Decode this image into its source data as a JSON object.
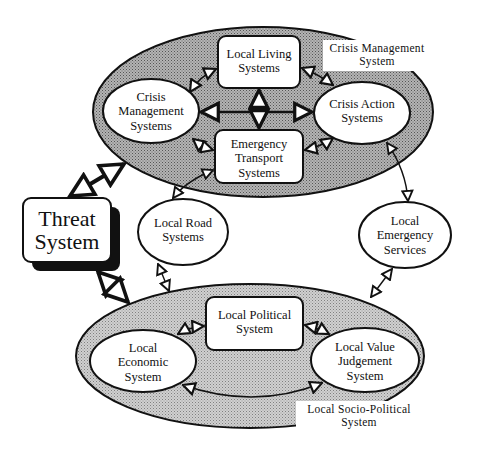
{
  "diagram": {
    "type": "system-interaction-diagram",
    "groups": [
      {
        "id": "crisis",
        "caption_line1": "Crisis Management",
        "caption_line2": "System"
      },
      {
        "id": "socio",
        "caption_line1": "Local Socio-Political",
        "caption_line2": "System"
      }
    ],
    "nodes": {
      "threat": {
        "line1": "Threat",
        "line2": "System"
      },
      "local_living": {
        "line1": "Local Living",
        "line2": "Systems"
      },
      "crisis_mgmt": {
        "line1": "Crisis",
        "line2": "Management",
        "line3": "Systems"
      },
      "crisis_action": {
        "line1": "Crisis Action",
        "line2": "Systems"
      },
      "emergency_transport": {
        "line1": "Emergency",
        "line2": "Transport",
        "line3": "Systems"
      },
      "local_road": {
        "line1": "Local Road",
        "line2": "Systems"
      },
      "local_emergency": {
        "line1": "Local",
        "line2": "Emergency",
        "line3": "Services"
      },
      "local_political": {
        "line1": "Local Political",
        "line2": "System"
      },
      "local_economic": {
        "line1": "Local",
        "line2": "Economic",
        "line3": "System"
      },
      "local_value": {
        "line1": "Local Value",
        "line2": "Judgement",
        "line3": "System"
      }
    },
    "edges": [
      [
        "crisis_mgmt",
        "local_living"
      ],
      [
        "local_living",
        "crisis_action"
      ],
      [
        "crisis_mgmt",
        "crisis_action"
      ],
      [
        "local_living",
        "emergency_transport"
      ],
      [
        "crisis_mgmt",
        "emergency_transport"
      ],
      [
        "emergency_transport",
        "crisis_action"
      ],
      [
        "threat",
        "crisis_management_group"
      ],
      [
        "threat",
        "socio_political_group"
      ],
      [
        "emergency_transport",
        "local_road"
      ],
      [
        "local_road",
        "socio_political_group"
      ],
      [
        "crisis_action",
        "local_emergency"
      ],
      [
        "local_emergency",
        "socio_political_group"
      ],
      [
        "local_economic",
        "local_political"
      ],
      [
        "local_political",
        "local_value"
      ],
      [
        "local_economic",
        "local_value"
      ]
    ]
  }
}
